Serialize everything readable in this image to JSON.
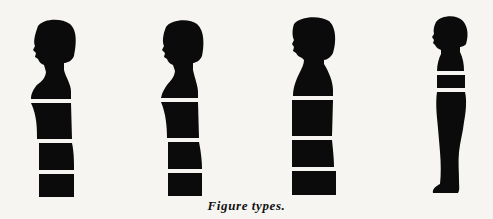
{
  "caption": "Figure types.",
  "figures": [
    {
      "label": "figure-1",
      "type": "bust with bands",
      "bands": 3
    },
    {
      "label": "figure-2",
      "type": "bust with bands",
      "bands": 3
    },
    {
      "label": "figure-3",
      "type": "bust with bands",
      "bands": 3
    },
    {
      "label": "figure-4",
      "type": "full child figure",
      "bands": 2
    }
  ],
  "colors": {
    "silhouette": "#0b0b0b",
    "background": "#f6f5f2",
    "band": "#f6f5f2"
  }
}
